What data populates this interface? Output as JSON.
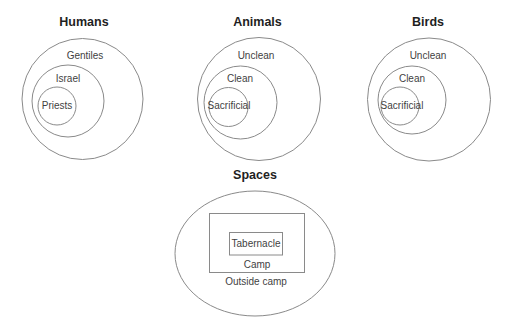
{
  "humans": {
    "title": "Humans",
    "outer": "Gentiles",
    "middle": "Israel",
    "inner": "Priests"
  },
  "animals": {
    "title": "Animals",
    "outer": "Unclean",
    "middle": "Clean",
    "inner": "Sacrificial"
  },
  "birds": {
    "title": "Birds",
    "outer": "Unclean",
    "middle": "Clean",
    "inner": "Sacrificial"
  },
  "spaces": {
    "title": "Spaces",
    "outer": "Outside camp",
    "middle": "Camp",
    "inner": "Tabernacle"
  },
  "colors": {
    "stroke": "#8a8a8a",
    "title_text": "#1f1f1f",
    "label_text": "#3f3f3f",
    "background": "#ffffff"
  }
}
